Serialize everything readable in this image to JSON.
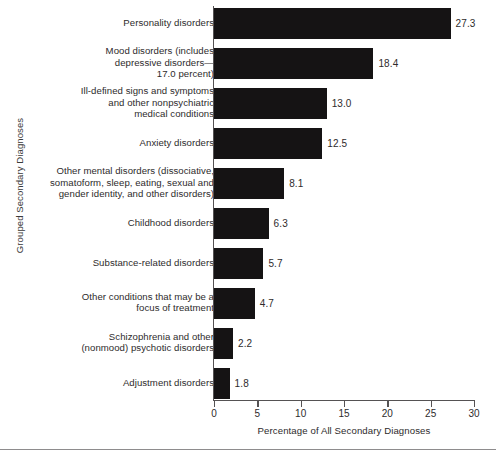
{
  "chart_data": {
    "type": "bar",
    "orientation": "horizontal",
    "title": "",
    "xlabel": "Percentage of All Secondary Diagnoses",
    "ylabel": "Grouped Secondary Diagnoses",
    "xlim": [
      0,
      30
    ],
    "xticks": [
      0,
      5,
      10,
      15,
      20,
      25,
      30
    ],
    "xtick_labels": [
      "0",
      "5",
      "10",
      "15",
      "20",
      "25",
      "30"
    ],
    "grid": false,
    "legend": false,
    "bar_color": "#151314",
    "axis_color": "#555253",
    "categories": [
      "Personality disorders",
      "Mood disorders (includes depressive disorders—17.0 percent)",
      "Ill-defined signs and symptoms and other nonpsychiatric medical conditions",
      "Anxiety disorders",
      "Other mental disorders (dissociative, somatoform, sleep, eating, sexual and gender identity, and other disorders)",
      "Childhood disorders",
      "Substance-related disorders",
      "Other conditions that may be a focus of treatment",
      "Schizophrenia and other (nonmood) psychotic disorders",
      "Adjustment disorders"
    ],
    "values": [
      27.3,
      18.4,
      13.0,
      12.5,
      8.1,
      6.3,
      5.7,
      4.7,
      2.2,
      1.8
    ],
    "value_labels": [
      "27.3",
      "18.4",
      "13.0",
      "12.5",
      "8.1",
      "6.3",
      "5.7",
      "4.7",
      "2.2",
      "1.8"
    ]
  },
  "categories_wrapped": [
    [
      "Personality disorders"
    ],
    [
      "Mood disorders (includes",
      "depressive disorders—",
      "17.0 percent)"
    ],
    [
      "Ill-defined signs and symptoms",
      "and other nonpsychiatric",
      "medical conditions"
    ],
    [
      "Anxiety disorders"
    ],
    [
      "Other mental disorders (dissociative,",
      "somatoform, sleep, eating, sexual and",
      "gender identity, and other disorders)"
    ],
    [
      "Childhood disorders"
    ],
    [
      "Substance-related disorders"
    ],
    [
      "Other conditions that may be a",
      "focus of treatment"
    ],
    [
      "Schizophrenia and other",
      "(nonmood) psychotic disorders"
    ],
    [
      "Adjustment disorders"
    ]
  ]
}
